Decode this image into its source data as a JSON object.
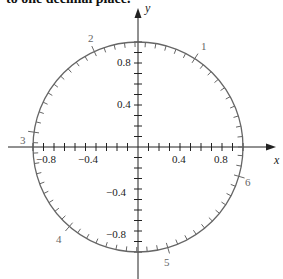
{
  "header": {
    "text": "to one decimal place."
  },
  "diagram": {
    "type": "unit-circle",
    "x_axis_label": "x",
    "y_axis_label": "y",
    "x_tick_labels": [
      "−0.8",
      "−0.4",
      "0.4",
      "0.8"
    ],
    "y_tick_labels": [
      "0.8",
      "0.4",
      "−0.4",
      "−0.8"
    ],
    "arc_labels": [
      "1",
      "2",
      "3",
      "4",
      "5",
      "6"
    ],
    "arc_tick_spacing_radians": 0.1,
    "axis_tick_spacing": 0.1,
    "colors": {
      "circle": "#666666",
      "axes": "#222222",
      "arc_labels": "#666666"
    }
  }
}
